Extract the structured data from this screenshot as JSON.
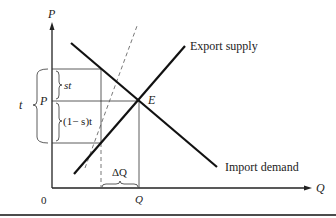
{
  "diagram": {
    "axes": {
      "y_label": "P",
      "x_label": "Q",
      "origin": "0"
    },
    "curves": {
      "export_supply": "Export supply",
      "import_demand": "Import demand"
    },
    "points": {
      "equilibrium": "E"
    },
    "labels": {
      "price_P": "P",
      "quantity_Q": "Q",
      "tariff_t": "t",
      "st": "st",
      "one_minus_s_t": "(1− s)t",
      "delta_Q": "ΔQ"
    },
    "colors": {
      "line": "#111111",
      "thin": "#333333",
      "dashed": "#555555"
    }
  }
}
